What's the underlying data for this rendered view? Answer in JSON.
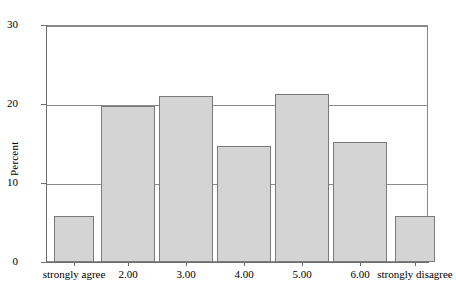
{
  "chart_data": {
    "type": "bar",
    "title": "",
    "subtitle": "",
    "xlabel": "",
    "ylabel": "Percent",
    "categories": [
      "strongly agree",
      "2.00",
      "3.00",
      "4.00",
      "5.00",
      "6.00",
      "strongly disagree"
    ],
    "values": [
      5.9,
      19.8,
      21.1,
      14.7,
      21.3,
      15.3,
      5.8
    ],
    "series": [
      {
        "name": "Percent",
        "values": [
          5.9,
          19.8,
          21.1,
          14.7,
          21.3,
          15.3,
          5.8
        ]
      }
    ],
    "ylim": [
      0,
      30
    ],
    "yticks": [
      0,
      10,
      20,
      30
    ],
    "ytick_labels": [
      "0",
      "10",
      "20",
      "30"
    ],
    "grid": "horizontal",
    "legend": "none",
    "bar_fill_color": "#d4d4d4",
    "bar_border_color": "#7a7a7a",
    "axis_color": "#6e6e6e",
    "background_color": "#ffffff"
  },
  "axes": {
    "y_title": "Percent",
    "y_tick_0": "0",
    "y_tick_1": "10",
    "y_tick_2": "20",
    "y_tick_3": "30"
  },
  "x_labels": {
    "cat0": "strongly agree",
    "cat1": "2.00",
    "cat2": "3.00",
    "cat3": "4.00",
    "cat4": "5.00",
    "cat5": "6.00",
    "cat6": "strongly disagree"
  }
}
